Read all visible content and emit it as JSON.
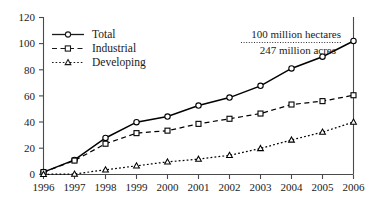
{
  "chart_data": {
    "type": "line",
    "title": "",
    "subtitle": "",
    "xlabel": "",
    "ylabel": "",
    "categories": [
      "1996",
      "1997",
      "1998",
      "1999",
      "2000",
      "2001",
      "2002",
      "2003",
      "2004",
      "2005",
      "2006"
    ],
    "x": [
      1996,
      1997,
      1998,
      1999,
      2000,
      2001,
      2002,
      2003,
      2004,
      2005,
      2006
    ],
    "xlim": [
      1996,
      2006
    ],
    "ylim": [
      0,
      120
    ],
    "yticks": [
      0,
      20,
      40,
      60,
      80,
      100,
      120
    ],
    "ytick_labels": [
      "0",
      "20",
      "40",
      "60",
      "80",
      "100",
      "120"
    ],
    "grid": false,
    "legend_position": "top-left",
    "series": [
      {
        "name": "Total",
        "marker": "circle",
        "line_style": "solid",
        "color": "#000000",
        "values": [
          1.7,
          11.0,
          27.8,
          39.9,
          44.2,
          52.6,
          58.7,
          67.7,
          81.0,
          90.0,
          102.0
        ]
      },
      {
        "name": "Industrial",
        "marker": "square",
        "line_style": "dashed",
        "color": "#000000",
        "values": [
          1.7,
          10.5,
          23.4,
          31.5,
          33.4,
          38.6,
          42.5,
          46.5,
          53.4,
          56.0,
          60.5
        ]
      },
      {
        "name": "Developing",
        "marker": "triangle",
        "line_style": "dotted",
        "color": "#000000",
        "values": [
          0.0,
          0.2,
          3.5,
          6.5,
          9.5,
          11.6,
          14.5,
          19.8,
          26.3,
          32.3,
          40.0
        ]
      }
    ],
    "annotations": [
      {
        "id": "hectares",
        "text": "100 million hectares"
      },
      {
        "id": "acres",
        "text": "247 million acres"
      }
    ]
  }
}
